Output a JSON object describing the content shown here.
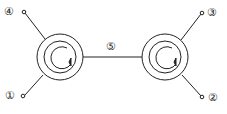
{
  "diagram": {
    "type": "two coupled coil / circulator symbols",
    "stroke_color": "#222222",
    "background": "#ffffff",
    "labels": {
      "port1": "①",
      "port2": "②",
      "port3": "③",
      "port4": "④",
      "link": "⑤"
    },
    "left_element": {
      "center": [
        60,
        57
      ],
      "outer_radius": 23,
      "inner_radius": 16,
      "arrow": "clockwise"
    },
    "right_element": {
      "center": [
        165,
        57
      ],
      "outer_radius": 23,
      "inner_radius": 16,
      "arrow": "clockwise"
    }
  }
}
